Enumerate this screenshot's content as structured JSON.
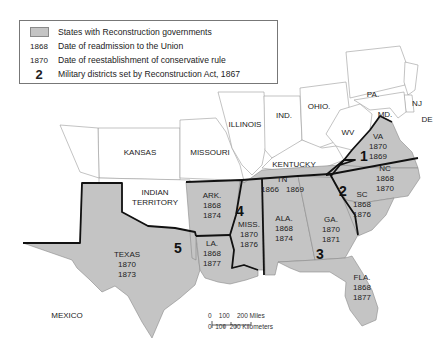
{
  "legend": {
    "items": [
      {
        "key_type": "swatch",
        "key": "",
        "label": "States with Reconstruction governments"
      },
      {
        "key_type": "number",
        "key": "1868",
        "label": "Date of readmission to the Union"
      },
      {
        "key_type": "number",
        "key": "1870",
        "label": "Date of reestablishment of conservative rule"
      },
      {
        "key_type": "district",
        "key": "2",
        "label": "Military districts set by Reconstruction Act, 1867"
      }
    ],
    "swatch_color": "#c4c4c4"
  },
  "reconstruction_states": [
    {
      "name": "VA",
      "readmission": "1870",
      "conservative_rule": "1869"
    },
    {
      "name": "NC",
      "readmission": "1868",
      "conservative_rule": "1870"
    },
    {
      "name": "SC",
      "readmission": "1868",
      "conservative_rule": "1876"
    },
    {
      "name": "TN",
      "readmission": "1866",
      "conservative_rule": "1869"
    },
    {
      "name": "GA.",
      "readmission": "1870",
      "conservative_rule": "1871"
    },
    {
      "name": "ALA.",
      "readmission": "1868",
      "conservative_rule": "1874"
    },
    {
      "name": "MISS.",
      "readmission": "1870",
      "conservative_rule": "1876"
    },
    {
      "name": "ARK.",
      "readmission": "1868",
      "conservative_rule": "1874"
    },
    {
      "name": "LA.",
      "readmission": "1868",
      "conservative_rule": "1877"
    },
    {
      "name": "TEXAS",
      "readmission": "1870",
      "conservative_rule": "1873"
    },
    {
      "name": "FLA.",
      "readmission": "1868",
      "conservative_rule": "1877"
    }
  ],
  "other_regions": [
    "KANSAS",
    "MISSOURI",
    "ILLINOIS",
    "IND.",
    "OHIO.",
    "PA.",
    "NJ",
    "DE",
    "MD.",
    "WV",
    "KENTUCKY",
    "INDIAN",
    "TERRITORY",
    "MEXICO"
  ],
  "districts": [
    "1",
    "2",
    "3",
    "4",
    "5"
  ],
  "scale": {
    "miles_label": "0    100    200 Miles",
    "km_label": "0  100  200 Kilometers"
  },
  "colors": {
    "reconstruction_fill": "#c4c4c4",
    "other_fill": "#ffffff",
    "district_border": "#111111"
  }
}
